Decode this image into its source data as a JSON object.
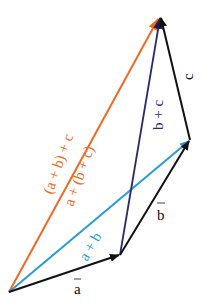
{
  "diagram": {
    "points": {
      "O": [
        9,
        292
      ],
      "A": [
        120,
        255
      ],
      "B": [
        190,
        140
      ],
      "C": [
        160,
        16
      ]
    },
    "vectors": [
      {
        "id": "a",
        "from": "O",
        "to": "A",
        "label": "a",
        "color": "#111111"
      },
      {
        "id": "b",
        "from": "A",
        "to": "B",
        "label": "b",
        "color": "#111111"
      },
      {
        "id": "c",
        "from": "B",
        "to": "C",
        "label": "c",
        "color": "#111111"
      },
      {
        "id": "a_plus_b",
        "from": "O",
        "to": "B",
        "label": "a + b",
        "color": "#2a9ad8"
      },
      {
        "id": "b_plus_c",
        "from": "A",
        "to": "C",
        "label": "b + c",
        "color": "#2a2a6e"
      },
      {
        "id": "sum",
        "from": "O",
        "to": "C",
        "label_1": "(a + b) + c",
        "label_2": "a + (b + c)",
        "color": "#f06a25"
      }
    ]
  },
  "labels": {
    "a": "a",
    "b": "b",
    "c": "c",
    "a_plus_b": "a + b",
    "b_plus_c": "b + c",
    "sum_left": "(a + b) + c",
    "sum_right": "a + (b + c)"
  },
  "colors": {
    "black": "#111111",
    "blue": "#2a9ad8",
    "navy": "#2a2a6e",
    "orange": "#f06a25"
  }
}
